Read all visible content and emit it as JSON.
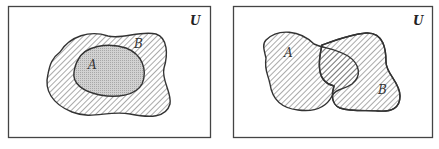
{
  "diagrams": [
    {
      "title": "A subset of B",
      "universe_label": "U",
      "set_outer_label": "B",
      "set_inner_label": "A",
      "relation": "A ⊂ B"
    },
    {
      "title": "A and B overlapping",
      "universe_label": "U",
      "set_a_label": "A",
      "set_b_label": "B",
      "relation": "A ∪ B"
    }
  ],
  "colors": {
    "border": "#444444",
    "hatch": "#555555",
    "inner_fill": "#c8c8c8",
    "background": "#ffffff"
  }
}
